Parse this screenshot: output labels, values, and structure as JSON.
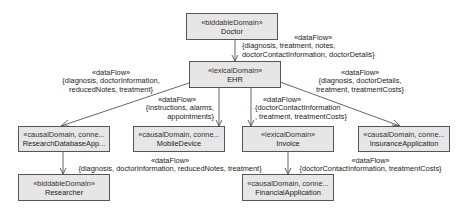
{
  "diagram": {
    "nodes": {
      "doctor": {
        "stereotype": "«biddableDomain»",
        "name": "Doctor"
      },
      "ehr": {
        "stereotype": "«lexicalDomain»",
        "name": "EHR"
      },
      "research_db": {
        "stereotype": "«causalDomain, conne...",
        "name": "ResearchDatabaseApp..."
      },
      "mobile": {
        "stereotype": "«causalDomain, conne...",
        "name": "MobileDevice"
      },
      "invoice": {
        "stereotype": "«lexicalDomain»",
        "name": "Invoice"
      },
      "insurance": {
        "stereotype": "«causalDomain, conne...",
        "name": "InsuranceApplication"
      },
      "researcher": {
        "stereotype": "«biddableDomain»",
        "name": "Researcher"
      },
      "financial": {
        "stereotype": "«causalDomain, conne...",
        "name": "FinancialApplication"
      }
    },
    "edges": {
      "doctor_ehr": {
        "stereotype": "«dataFlow»",
        "line1": "{diagnosis, treatment, notes,",
        "line2": "doctorContactInformation, doctorDetails}"
      },
      "ehr_research": {
        "stereotype": "«dataFlow»",
        "line1": "{diagnosis, doctorInformation,",
        "line2": "reducedNotes, treatment}"
      },
      "ehr_mobile": {
        "stereotype": "«dataFlow»",
        "line1": "{instructions, alarms,",
        "line2": "appointments}"
      },
      "ehr_invoice": {
        "stereotype": "«dataFlow»",
        "line1": "{doctorContactInformation",
        "line2": ", treatment, treatmentCosts}"
      },
      "ehr_insurance": {
        "stereotype": "«dataFlow»",
        "line1": "{diagnosis, doctorDetails,",
        "line2": "treatment, treatmentCosts}"
      },
      "research_researcher": {
        "stereotype": "«dataFlow»",
        "line1": "{diagnosis, doctorInformation, reducedNotes, treatment}"
      },
      "invoice_financial": {
        "stereotype": "«dataFlow»",
        "line1": "{doctorContactInformation, treatmentCosts}"
      }
    }
  }
}
